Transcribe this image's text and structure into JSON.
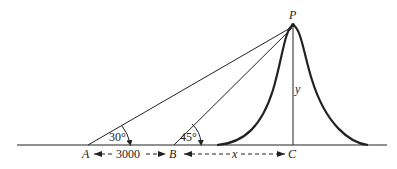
{
  "diagram": {
    "type": "geometry-elevation-problem",
    "points": {
      "A": {
        "label": "A"
      },
      "B": {
        "label": "B"
      },
      "C": {
        "label": "C"
      },
      "P": {
        "label": "P"
      }
    },
    "angles": {
      "at_A": "30°",
      "at_B": "45°"
    },
    "distances": {
      "AB": "3000",
      "BC": "x",
      "PC": "y"
    },
    "colors": {
      "line": "#222222",
      "background": "#ffffff"
    }
  }
}
